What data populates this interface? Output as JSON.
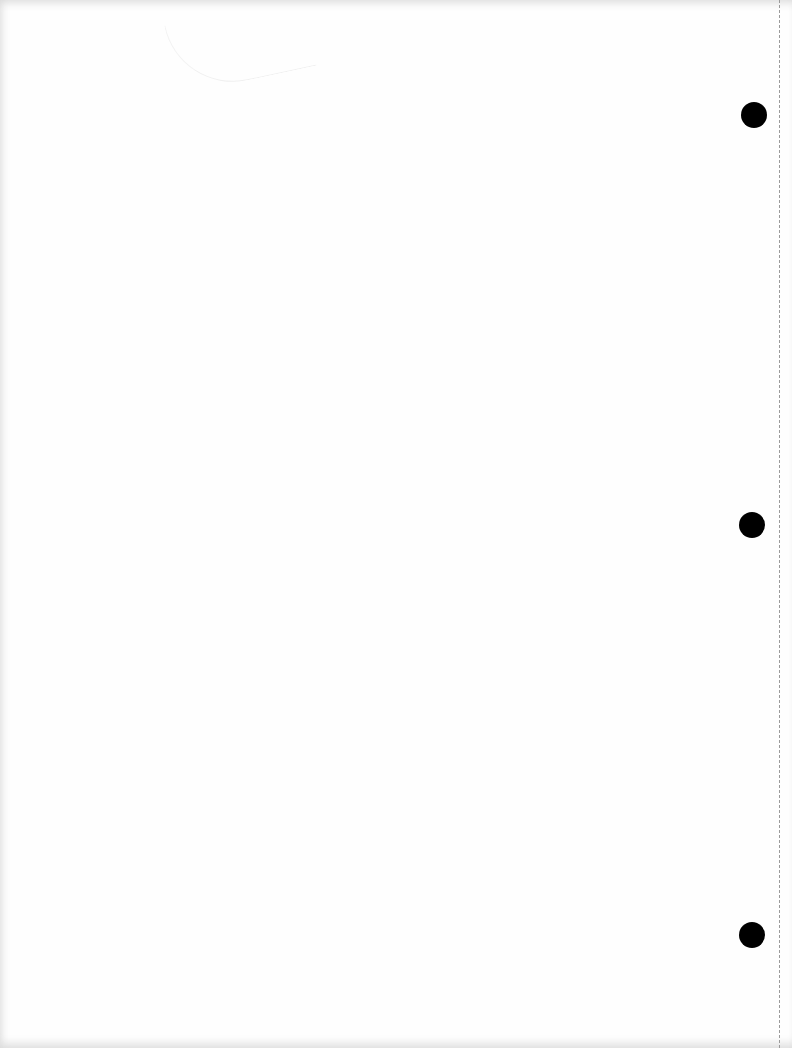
{
  "page": {
    "type": "blank-scanned-page",
    "background_color": "#fefefe",
    "punch_holes": [
      {
        "label": "top",
        "cx": 754,
        "cy": 115,
        "diameter": 26,
        "color": "#000000"
      },
      {
        "label": "middle",
        "cx": 752,
        "cy": 525,
        "diameter": 26,
        "color": "#000000"
      },
      {
        "label": "bottom",
        "cx": 752,
        "cy": 935,
        "diameter": 26,
        "color": "#000000"
      }
    ],
    "perforation_line": {
      "x": 779,
      "style": "dashed",
      "color": "#9a9a9a"
    }
  }
}
